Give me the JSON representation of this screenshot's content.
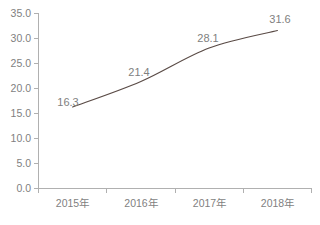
{
  "chart_data": {
    "type": "line",
    "title": "",
    "subtitle": "",
    "xlabel": "",
    "ylabel": "",
    "categories": [
      "2015年",
      "2016年",
      "2017年",
      "2018年"
    ],
    "series": [
      {
        "name": "",
        "values": [
          16.3,
          21.4,
          28.1,
          31.6
        ]
      }
    ],
    "data_labels": [
      "16.3",
      "21.4",
      "28.1",
      "31.6"
    ],
    "ylim": [
      0.0,
      35.0
    ],
    "y_ticks": [
      0.0,
      5.0,
      10.0,
      15.0,
      20.0,
      25.0,
      30.0,
      35.0
    ],
    "y_tick_labels": [
      "0.0",
      "5.0",
      "10.0",
      "15.0",
      "20.0",
      "25.0",
      "30.0",
      "35.0"
    ],
    "x_tick_labels": [
      "2015年",
      "2016年",
      "2017年",
      "2018年"
    ],
    "grid": false,
    "legend": false,
    "legend_position": "none",
    "colors": {
      "line": "#5a4b46",
      "axis": "#b0b0b0",
      "tick_text": "#7f7f7f",
      "data_label_text": "#808080",
      "background": "#ffffff"
    }
  }
}
